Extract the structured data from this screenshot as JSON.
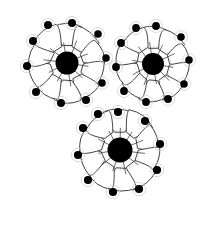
{
  "figure": {
    "background_color": "#ffffff",
    "outline_color": "#2b2b2b",
    "nucleus_color": "#000000",
    "hub_color": "#000000",
    "halo_color": "#bdbdbd",
    "canvas": {
      "width": 216,
      "height": 226
    },
    "drawing_bounds": {
      "left": 14,
      "top": 12,
      "right": 200,
      "bottom": 205
    }
  },
  "chart_data": {
    "type": "diagram",
    "rosette_count": 3,
    "total_cells": 30,
    "rosettes": [
      {
        "name": "upper-left-rosette",
        "hub": {
          "cx": 67,
          "cy": 63,
          "r": 11.5
        },
        "petal_count": 10,
        "spoke_count": 10,
        "halo_radius": 19,
        "cells": [
          {
            "angle": 270,
            "nucleus": {
              "cx": 72,
              "cy": 23,
              "r": 4.0
            },
            "inner": 17,
            "outer": 43,
            "half_width": 15
          },
          {
            "angle": 306,
            "nucleus": {
              "cx": 98,
              "cy": 34,
              "r": 3.8
            },
            "inner": 17,
            "outer": 42,
            "half_width": 14
          },
          {
            "angle": 342,
            "nucleus": {
              "cx": 106,
              "cy": 58,
              "r": 3.8
            },
            "inner": 16,
            "outer": 40,
            "half_width": 13
          },
          {
            "angle": 18,
            "nucleus": {
              "cx": 102,
              "cy": 83,
              "r": 3.8
            },
            "inner": 16,
            "outer": 40,
            "half_width": 13
          },
          {
            "angle": 54,
            "nucleus": {
              "cx": 86,
              "cy": 100,
              "r": 4.0
            },
            "inner": 17,
            "outer": 43,
            "half_width": 14
          },
          {
            "angle": 90,
            "nucleus": {
              "cx": 61,
              "cy": 103,
              "r": 4.0
            },
            "inner": 17,
            "outer": 43,
            "half_width": 14
          },
          {
            "angle": 126,
            "nucleus": {
              "cx": 36,
              "cy": 92,
              "r": 4.0
            },
            "inner": 17,
            "outer": 42,
            "half_width": 14
          },
          {
            "angle": 162,
            "nucleus": {
              "cx": 27,
              "cy": 66,
              "r": 4.0
            },
            "inner": 16,
            "outer": 41,
            "half_width": 14
          },
          {
            "angle": 198,
            "nucleus": {
              "cx": 33,
              "cy": 41,
              "r": 4.0
            },
            "inner": 16,
            "outer": 41,
            "half_width": 14
          },
          {
            "angle": 234,
            "nucleus": {
              "cx": 48,
              "cy": 25,
              "r": 4.0
            },
            "inner": 17,
            "outer": 43,
            "half_width": 15
          }
        ]
      },
      {
        "name": "upper-right-rosette",
        "hub": {
          "cx": 153,
          "cy": 64,
          "r": 11.0
        },
        "petal_count": 10,
        "spoke_count": 10,
        "halo_radius": 18,
        "cells": [
          {
            "angle": 272,
            "nucleus": {
              "cx": 156,
              "cy": 26,
              "r": 3.9
            },
            "inner": 16,
            "outer": 41,
            "half_width": 14
          },
          {
            "angle": 308,
            "nucleus": {
              "cx": 181,
              "cy": 37,
              "r": 3.8
            },
            "inner": 16,
            "outer": 40,
            "half_width": 13
          },
          {
            "angle": 344,
            "nucleus": {
              "cx": 189,
              "cy": 60,
              "r": 3.8
            },
            "inner": 16,
            "outer": 39,
            "half_width": 13
          },
          {
            "angle": 20,
            "nucleus": {
              "cx": 184,
              "cy": 84,
              "r": 3.8
            },
            "inner": 16,
            "outer": 39,
            "half_width": 13
          },
          {
            "angle": 56,
            "nucleus": {
              "cx": 168,
              "cy": 99,
              "r": 3.9
            },
            "inner": 16,
            "outer": 40,
            "half_width": 13
          },
          {
            "angle": 92,
            "nucleus": {
              "cx": 146,
              "cy": 102,
              "r": 3.9
            },
            "inner": 16,
            "outer": 40,
            "half_width": 13
          },
          {
            "angle": 128,
            "nucleus": {
              "cx": 124,
              "cy": 91,
              "r": 3.9
            },
            "inner": 16,
            "outer": 40,
            "half_width": 13
          },
          {
            "angle": 164,
            "nucleus": {
              "cx": 116,
              "cy": 67,
              "r": 3.9
            },
            "inner": 16,
            "outer": 39,
            "half_width": 13
          },
          {
            "angle": 200,
            "nucleus": {
              "cx": 121,
              "cy": 43,
              "r": 3.9
            },
            "inner": 16,
            "outer": 40,
            "half_width": 13
          },
          {
            "angle": 236,
            "nucleus": {
              "cx": 136,
              "cy": 28,
              "r": 3.9
            },
            "inner": 16,
            "outer": 41,
            "half_width": 14
          }
        ]
      },
      {
        "name": "bottom-center-rosette",
        "hub": {
          "cx": 120,
          "cy": 150,
          "r": 12.5
        },
        "petal_count": 10,
        "spoke_count": 11,
        "halo_radius": 20,
        "cells": [
          {
            "angle": 268,
            "nucleus": {
              "cx": 118,
              "cy": 112,
              "r": 4.1
            },
            "inner": 18,
            "outer": 44,
            "half_width": 15
          },
          {
            "angle": 304,
            "nucleus": {
              "cx": 145,
              "cy": 121,
              "r": 4.1
            },
            "inner": 18,
            "outer": 44,
            "half_width": 15
          },
          {
            "angle": 340,
            "nucleus": {
              "cx": 160,
              "cy": 144,
              "r": 4.1
            },
            "inner": 18,
            "outer": 43,
            "half_width": 14
          },
          {
            "angle": 16,
            "nucleus": {
              "cx": 157,
              "cy": 170,
              "r": 4.1
            },
            "inner": 18,
            "outer": 43,
            "half_width": 14
          },
          {
            "angle": 52,
            "nucleus": {
              "cx": 139,
              "cy": 189,
              "r": 4.1
            },
            "inner": 18,
            "outer": 45,
            "half_width": 15
          },
          {
            "angle": 88,
            "nucleus": {
              "cx": 113,
              "cy": 192,
              "r": 4.1
            },
            "inner": 18,
            "outer": 45,
            "half_width": 15
          },
          {
            "angle": 124,
            "nucleus": {
              "cx": 88,
              "cy": 180,
              "r": 4.1
            },
            "inner": 18,
            "outer": 44,
            "half_width": 15
          },
          {
            "angle": 160,
            "nucleus": {
              "cx": 78,
              "cy": 155,
              "r": 4.1
            },
            "inner": 18,
            "outer": 43,
            "half_width": 14
          },
          {
            "angle": 196,
            "nucleus": {
              "cx": 83,
              "cy": 128,
              "r": 4.1
            },
            "inner": 18,
            "outer": 43,
            "half_width": 14
          },
          {
            "angle": 232,
            "nucleus": {
              "cx": 98,
              "cy": 114,
              "r": 4.1
            },
            "inner": 18,
            "outer": 44,
            "half_width": 15
          }
        ]
      }
    ]
  }
}
